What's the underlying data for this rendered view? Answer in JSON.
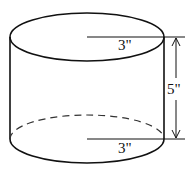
{
  "diagram": {
    "shape": "cylinder",
    "top_radius_label": "3\"",
    "bottom_radius_label": "3\"",
    "height_label": "5\"",
    "stroke_color": "#111111"
  }
}
